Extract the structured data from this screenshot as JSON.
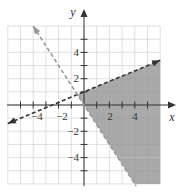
{
  "chart_data": {
    "type": "line",
    "title": "",
    "subtitle": "",
    "xlabel": "x",
    "ylabel": "y",
    "xlim": [
      -6,
      6
    ],
    "ylim": [
      -6,
      6
    ],
    "grid": true,
    "x_tick_labels": [
      "-4",
      "-2",
      "2",
      "4"
    ],
    "x_tick_values": [
      -4,
      -2,
      2,
      4
    ],
    "y_tick_labels": [
      "4",
      "2",
      "-2",
      "-4"
    ],
    "y_tick_values": [
      4,
      2,
      -2,
      -4
    ],
    "tick_marks_every": 1,
    "series": [
      {
        "name": "boundary-1",
        "equation": "y = 0.4x + 1",
        "style": "dashed",
        "color": "#333333",
        "arrows": "both",
        "points": [
          [
            -6,
            -1.4
          ],
          [
            6,
            3.4
          ]
        ]
      },
      {
        "name": "boundary-2",
        "equation": "y = -1.5x",
        "style": "dashed",
        "color": "#999999",
        "arrows": "start",
        "points": [
          [
            -4,
            6
          ],
          [
            4.1,
            -6.15
          ]
        ]
      }
    ],
    "shaded_region": {
      "description": "region below y = 0.4x + 1 and above y = -1.5x",
      "color": "#a9a9a9",
      "vertices": [
        [
          -0.526,
          0.789
        ],
        [
          6,
          3.4
        ],
        [
          6,
          -6
        ],
        [
          4,
          -6
        ]
      ]
    },
    "legend": null
  },
  "labels": {
    "x_axis": "x",
    "y_axis": "y",
    "x_ticks": [
      "−4",
      "−2",
      "2",
      "4"
    ],
    "y_ticks": [
      "4",
      "2",
      "−2",
      "−4"
    ]
  }
}
